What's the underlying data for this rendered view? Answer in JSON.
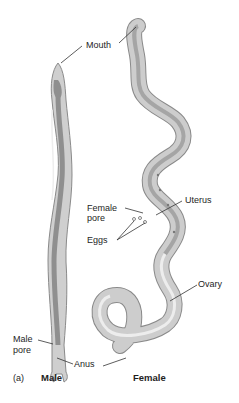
{
  "figure": {
    "panel_label": "(a)",
    "captions": {
      "male": "Male",
      "female": "Female"
    },
    "labels": {
      "mouth": "Mouth",
      "uterus": "Uterus",
      "female_pore_line1": "Female",
      "female_pore_line2": "pore",
      "eggs": "Eggs",
      "ovary": "Ovary",
      "male_pore_line1": "Male",
      "male_pore_line2": "pore",
      "anus": "Anus"
    },
    "colors": {
      "body_fill": "#c9c9c9",
      "body_edge": "#8a8a8a",
      "gut": "#7d7d7d",
      "highlight": "#ececec",
      "leader_line": "#333333"
    }
  }
}
